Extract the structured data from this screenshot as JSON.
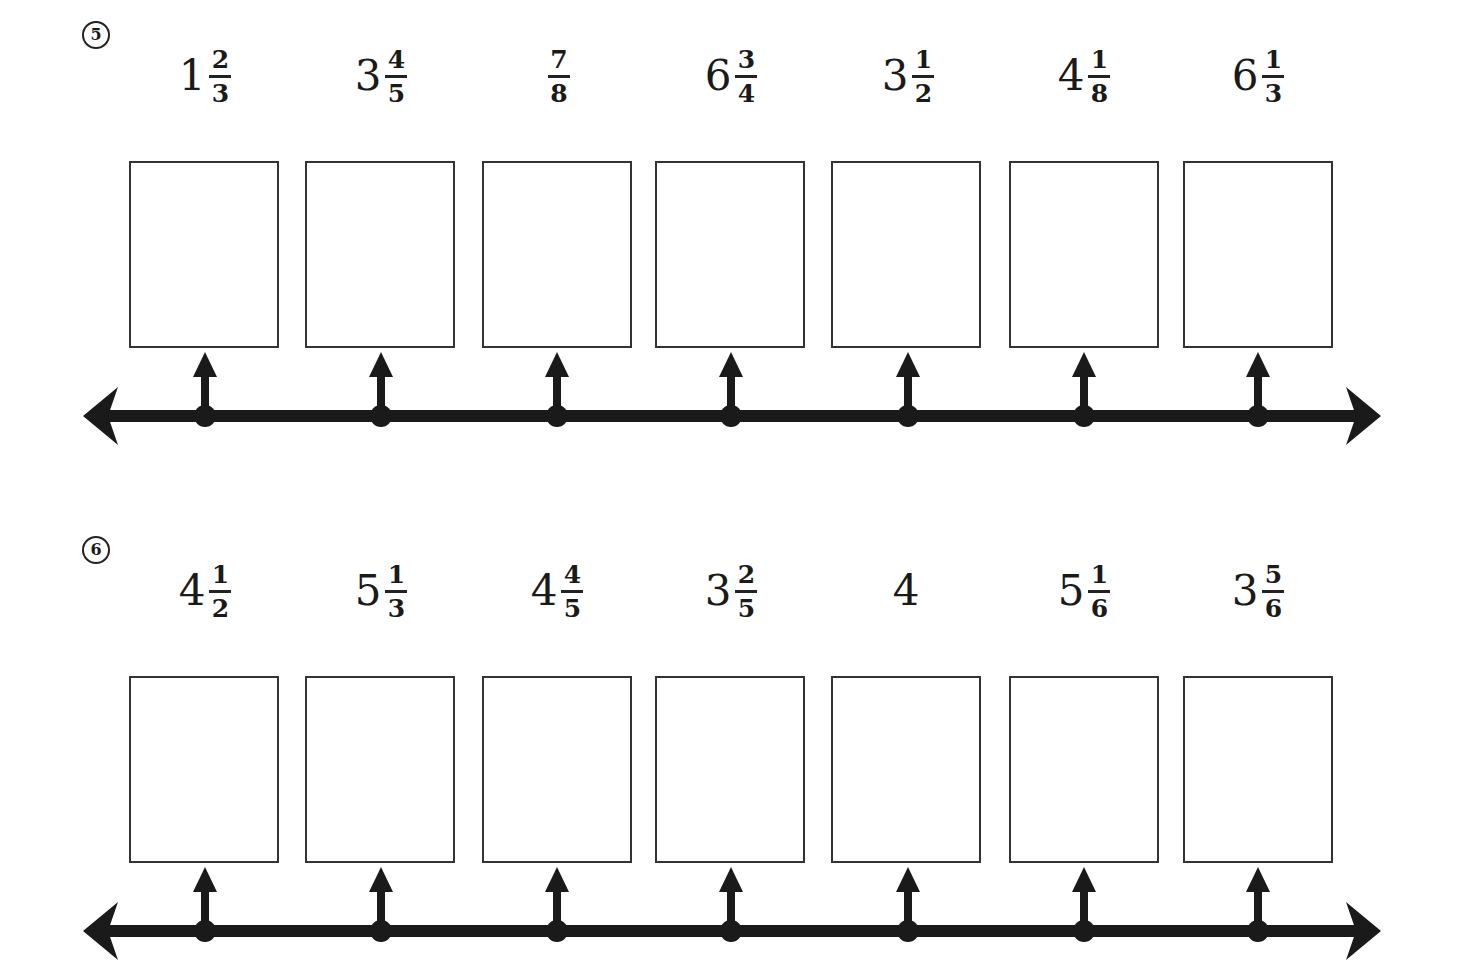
{
  "problems": [
    {
      "number": "5",
      "items": [
        {
          "whole": "1",
          "num": "2",
          "den": "3"
        },
        {
          "whole": "3",
          "num": "4",
          "den": "5"
        },
        {
          "whole": "",
          "num": "7",
          "den": "8"
        },
        {
          "whole": "6",
          "num": "3",
          "den": "4"
        },
        {
          "whole": "3",
          "num": "1",
          "den": "2"
        },
        {
          "whole": "4",
          "num": "1",
          "den": "8"
        },
        {
          "whole": "6",
          "num": "1",
          "den": "3"
        }
      ]
    },
    {
      "number": "6",
      "items": [
        {
          "whole": "4",
          "num": "1",
          "den": "2"
        },
        {
          "whole": "5",
          "num": "1",
          "den": "3"
        },
        {
          "whole": "4",
          "num": "4",
          "den": "5"
        },
        {
          "whole": "3",
          "num": "2",
          "den": "5"
        },
        {
          "whole": "4",
          "num": "",
          "den": ""
        },
        {
          "whole": "5",
          "num": "1",
          "den": "6"
        },
        {
          "whole": "3",
          "num": "5",
          "den": "6"
        }
      ]
    }
  ],
  "layout": {
    "point_x": [
      205,
      381,
      557,
      731,
      908,
      1084,
      1258
    ],
    "line_color": "#1a1a1a"
  }
}
